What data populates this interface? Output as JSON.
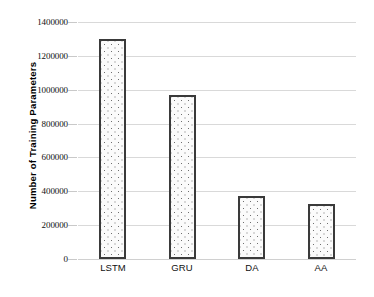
{
  "chart_data": {
    "type": "bar",
    "title": "",
    "xlabel": "",
    "ylabel": "Number of Training Parameters",
    "categories": [
      "LSTM",
      "GRU",
      "DA",
      "AA"
    ],
    "values": [
      1300000,
      970000,
      370000,
      325000
    ],
    "ylim": [
      0,
      1400000
    ],
    "ytick_step": 200000,
    "yticks": [
      0,
      200000,
      400000,
      600000,
      800000,
      1000000,
      1200000,
      1400000
    ],
    "ytick_labels": [
      "0",
      "200000",
      "400000",
      "600000",
      "800000",
      "1000000",
      "1200000",
      "1400000"
    ],
    "grid": true,
    "grid_axis": "y",
    "legend": false,
    "legend_position": "none",
    "bar_fill": "#fbfbfb",
    "bar_pattern": "dotted-stipple",
    "bar_border_color": "#3a3a3a",
    "gridline_color": "#d9d9d9",
    "background_color": "#ffffff",
    "text_color": "#111111"
  }
}
